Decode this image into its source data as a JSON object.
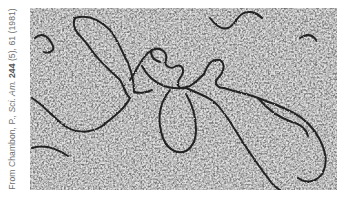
{
  "figure": {
    "type": "electron-micrograph",
    "colors": {
      "background": "#ffffff",
      "grain_dark": "#1a1a1a",
      "grain_light": "#e6e6e6",
      "filament": "#141414",
      "caption": "#6e6e6e"
    }
  },
  "credit": {
    "prefix": "From Chambon, P., ",
    "journal": "Sci. Am.",
    "space": " ",
    "volume": "244",
    "rest": " (5), 61 (1981)"
  }
}
